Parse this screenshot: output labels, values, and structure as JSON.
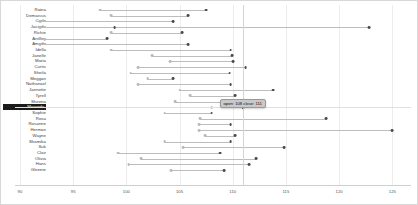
{
  "chart_data": {
    "type": "bar",
    "subtype": "dumbbell-range",
    "title": "",
    "xlabel": "",
    "ylabel": "",
    "xlim": [
      90,
      126
    ],
    "ticks": [
      90,
      95,
      100,
      105,
      110,
      115,
      120,
      125
    ],
    "tick_labels": [
      "90",
      "95",
      "100",
      "105",
      "110",
      "115",
      "120",
      "125"
    ],
    "grid": true,
    "legend": "none",
    "series": [
      {
        "name": "open",
        "color": "#b9b9b9"
      },
      {
        "name": "close",
        "color": "#4a4a4a"
      }
    ],
    "categories": [
      "Raina",
      "Demarcus",
      "Carlo",
      "Jacinda",
      "Richie",
      "Antony",
      "Amado",
      "Idella",
      "Janelle",
      "Maria",
      "Curtis",
      "Sheila",
      "Meggan",
      "Nathanael",
      "Jannette",
      "Tyrell",
      "Sheena",
      "Maranda",
      "Sophie",
      "Rosa",
      "Rosanne",
      "Herman",
      "Wayne",
      "Shamika",
      "Suk",
      "Clair",
      "Olivia",
      "Hans",
      "Glennie"
    ],
    "rows": [
      {
        "label": "Raina",
        "open": 97.5,
        "close": 107.5
      },
      {
        "label": "Demarcus",
        "open": 98.6,
        "close": 105.8
      },
      {
        "label": "Carlo",
        "open": 91.9,
        "close": 104.4
      },
      {
        "label": "Jacinda",
        "open": 91.9,
        "close": 98.9,
        "extra": 122.8
      },
      {
        "label": "Richie",
        "open": 98.6,
        "close": 105.2
      },
      {
        "label": "Antony",
        "open": 91.9,
        "close": 98.2
      },
      {
        "label": "Amado",
        "open": 91.9,
        "close": 105.8
      },
      {
        "label": "Idella",
        "open": 98.6,
        "close": 109.8
      },
      {
        "label": "Janelle",
        "open": 102.4,
        "close": 109.9
      },
      {
        "label": "Maria",
        "open": 104.1,
        "close": 110.0
      },
      {
        "label": "Curtis",
        "open": 101.1,
        "close": 111.2
      },
      {
        "label": "Sheila",
        "open": 100.4,
        "close": 109.7
      },
      {
        "label": "Meggan",
        "open": 102.0,
        "close": 104.4
      },
      {
        "label": "Nathanael",
        "open": 101.1,
        "close": 109.8
      },
      {
        "label": "Jannette",
        "open": 105.0,
        "close": 113.8
      },
      {
        "label": "Tyrell",
        "open": 106.0,
        "close": 110.2
      },
      {
        "label": "Sheena",
        "open": 104.6,
        "close": 111.0
      },
      {
        "label": "Maranda",
        "open": 108.0,
        "close": 111.0
      },
      {
        "label": "Sophie",
        "open": 103.6,
        "close": 108.0
      },
      {
        "label": "Rosa",
        "open": 106.9,
        "close": 118.8
      },
      {
        "label": "Rosanne",
        "open": 106.8,
        "close": 109.8
      },
      {
        "label": "Herman",
        "open": 106.8,
        "close": 125.0
      },
      {
        "label": "Wayne",
        "open": 107.4,
        "close": 110.2
      },
      {
        "label": "Shamika",
        "open": 103.6,
        "close": 109.8
      },
      {
        "label": "Suk",
        "open": 105.3,
        "close": 114.8
      },
      {
        "label": "Clair",
        "open": 99.2,
        "close": 108.8
      },
      {
        "label": "Olivia",
        "open": 101.4,
        "close": 112.2
      },
      {
        "label": "Hans",
        "open": 100.2,
        "close": 111.5
      },
      {
        "label": "Glennie",
        "open": 104.2,
        "close": 109.2
      }
    ]
  },
  "tooltip": {
    "text": "open: 108 close: 111",
    "row": "Maranda"
  },
  "selection": {
    "label": "Maranda"
  }
}
